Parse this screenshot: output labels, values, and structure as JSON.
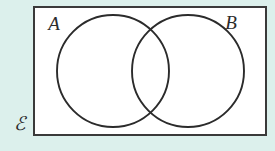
{
  "diagram": {
    "type": "venn-two-set",
    "background_color": "#dcf0ec",
    "universe": {
      "label": "ℰ",
      "label_name": "universal-set-symbol",
      "fill_color": "#ffffff",
      "stroke_color": "#3a3a3a",
      "x": 34,
      "y": 7,
      "width": 232,
      "height": 128,
      "label_x": 20,
      "label_y": 130
    },
    "sets": [
      {
        "label": "A",
        "name": "set-a",
        "cx": 113,
        "cy": 71,
        "r": 56,
        "stroke_color": "#2b2b2b",
        "fill_color": "none",
        "label_x": 54,
        "label_y": 30
      },
      {
        "label": "B",
        "name": "set-b",
        "cx": 188,
        "cy": 71,
        "r": 56,
        "stroke_color": "#2b2b2b",
        "fill_color": "none",
        "label_x": 231,
        "label_y": 29
      }
    ],
    "shading": "none",
    "intersection_points": [
      {
        "x": 150,
        "y": 33
      },
      {
        "x": 150,
        "y": 110
      }
    ]
  }
}
